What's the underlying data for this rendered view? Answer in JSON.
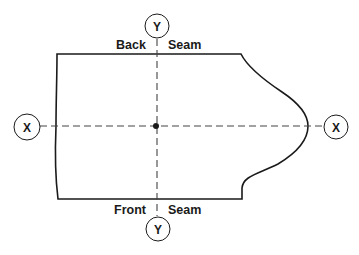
{
  "diagram": {
    "type": "pattern-piece-axes",
    "labels": {
      "top_left": "Back",
      "top_right": "Seam",
      "bottom_left": "Front",
      "bottom_right": "Seam"
    },
    "axes": {
      "y_top": "Y",
      "y_bottom": "Y",
      "x_left": "X",
      "x_right": "X"
    },
    "center_point": {
      "x": 156,
      "y": 126
    },
    "colors": {
      "line": "#1a1a1a",
      "dashed": "#444444",
      "background": "#ffffff"
    }
  }
}
